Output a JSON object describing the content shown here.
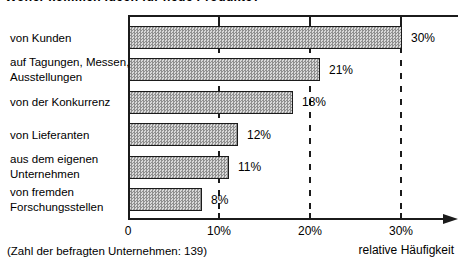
{
  "chart_data": {
    "type": "bar",
    "orientation": "horizontal",
    "title": "Woher kommen Ideen für neue Produkte?",
    "categories": [
      "von Kunden",
      "auf Tagungen, Messen,\nAusstellungen",
      "von der Konkurrenz",
      "von Lieferanten",
      "aus dem eigenen\nUnternehmen",
      "von fremden\nForschungsstellen"
    ],
    "values": [
      30,
      21,
      18,
      12,
      11,
      8
    ],
    "value_labels": [
      "30%",
      "21%",
      "18%",
      "12%",
      "11%",
      "8%"
    ],
    "xlabel": "relative Häufigkeit",
    "x_ticks": [
      {
        "value": 0,
        "label": "0"
      },
      {
        "value": 10,
        "label": "10%"
      },
      {
        "value": 20,
        "label": "20%"
      },
      {
        "value": 30,
        "label": "30%"
      }
    ],
    "xlim": [
      0,
      33
    ],
    "gridlines": {
      "style": "dashed",
      "at": [
        10,
        20,
        30
      ]
    },
    "legend": null,
    "note": "(Zahl der befragten Unternehmen: 139)",
    "colors": {
      "line": "#1b1b1b",
      "bar_pattern_dark": "#8f8f8f",
      "bar_pattern_light": "#d9d9d9",
      "text": "#000000"
    }
  }
}
